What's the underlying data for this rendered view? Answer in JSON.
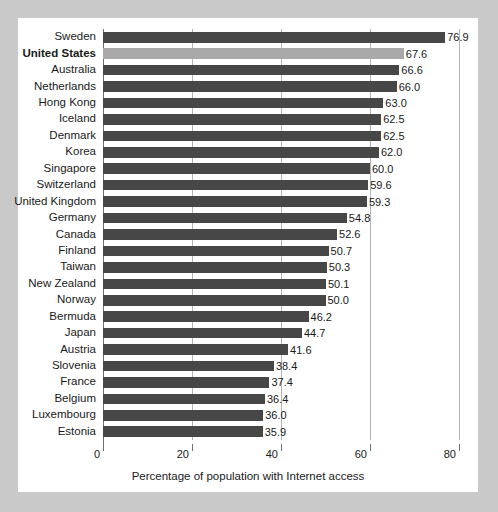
{
  "chart_data": {
    "type": "bar",
    "orientation": "horizontal",
    "title": "",
    "xlabel": "Percentage of population with Internet access",
    "ylabel": "",
    "xlim": [
      0,
      80
    ],
    "xticks": [
      0,
      20,
      40,
      60,
      80
    ],
    "xtick_labels": [
      "0",
      "20",
      "40",
      "60",
      "80"
    ],
    "grid": true,
    "grid_axis": "x",
    "legend": "none",
    "bar_color": "#474747",
    "highlight_color": "#a9a9a9",
    "highlight_category": "United States",
    "categories": [
      "Sweden",
      "United States",
      "Australia",
      "Netherlands",
      "Hong Kong",
      "Iceland",
      "Denmark",
      "Korea",
      "Singapore",
      "Switzerland",
      "United Kingdom",
      "Germany",
      "Canada",
      "Finland",
      "Taiwan",
      "New Zealand",
      "Norway",
      "Bermuda",
      "Japan",
      "Austria",
      "Slovenia",
      "France",
      "Belgium",
      "Luxembourg",
      "Estonia"
    ],
    "values": [
      76.9,
      67.6,
      66.6,
      66.0,
      63.0,
      62.5,
      62.5,
      62.0,
      60.0,
      59.6,
      59.3,
      54.8,
      52.6,
      50.7,
      50.3,
      50.1,
      50.0,
      46.2,
      44.7,
      41.6,
      38.4,
      37.4,
      36.4,
      36.0,
      35.9
    ],
    "value_labels": [
      "76.9",
      "67.6",
      "66.6",
      "66.0",
      "63.0",
      "62.5",
      "62.5",
      "62.0",
      "60.0",
      "59.6",
      "59.3",
      "54.8",
      "52.6",
      "50.7",
      "50.3",
      "50.1",
      "50.0",
      "46.2",
      "44.7",
      "41.6",
      "38.4",
      "37.4",
      "36.4",
      "36.0",
      "35.9"
    ]
  }
}
